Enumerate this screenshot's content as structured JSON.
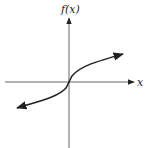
{
  "diagram": {
    "type": "function-graph",
    "y_axis_label": "f(x)",
    "x_axis_label": "x",
    "curve_description": "increasing cube-root-like curve through origin, arrows on both ends",
    "colors": {
      "axes": "#555555",
      "curve": "#222222",
      "background": "#ffffff"
    }
  }
}
